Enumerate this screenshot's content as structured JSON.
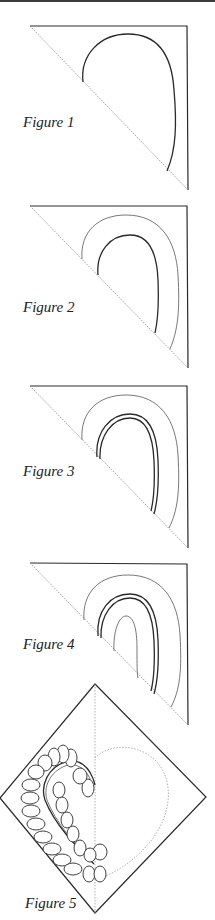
{
  "page": {
    "header_rule": true,
    "figures": [
      {
        "id": 1,
        "label": "Figure 1",
        "description": "Right triangle with one half-heart outline drawn along the dashed diagonal"
      },
      {
        "id": 2,
        "label": "Figure 2",
        "description": "Half-heart with an added outer echo line"
      },
      {
        "id": 3,
        "label": "Figure 3",
        "description": "Half-heart drawn as a double line with outer echo line"
      },
      {
        "id": 4,
        "label": "Figure 4",
        "description": "Double-line half-heart with outer echo line and inner echo line"
      },
      {
        "id": 5,
        "label": "Figure 5",
        "description": "Square-on-point block with dashed center line, feather plume on left and dashed heart outline on right"
      }
    ]
  },
  "colors": {
    "ink": "#2a2a2a",
    "dashed": "#8a8a8a",
    "background": "#ffffff"
  }
}
